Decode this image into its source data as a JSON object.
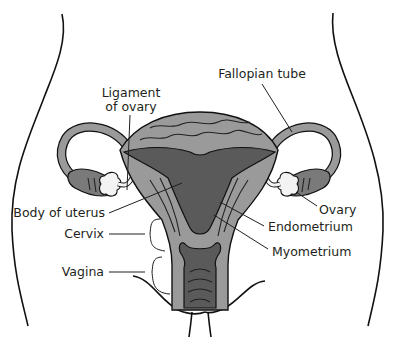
{
  "diagram": {
    "colors": {
      "myometrium": "#9a9a9a",
      "endometrium": "#5a5a5a",
      "ovary": "#f3f3f3",
      "outline": "#111111",
      "background": "#ffffff"
    },
    "labels": {
      "ligament_of_ovary_line1": "Ligament",
      "ligament_of_ovary_line2": "of ovary",
      "fallopian_tube": "Fallopian tube",
      "body_of_uterus": "Body of uterus",
      "ovary": "Ovary",
      "endometrium": "Endometrium",
      "cervix": "Cervix",
      "myometrium": "Myometrium",
      "vagina": "Vagina"
    }
  }
}
